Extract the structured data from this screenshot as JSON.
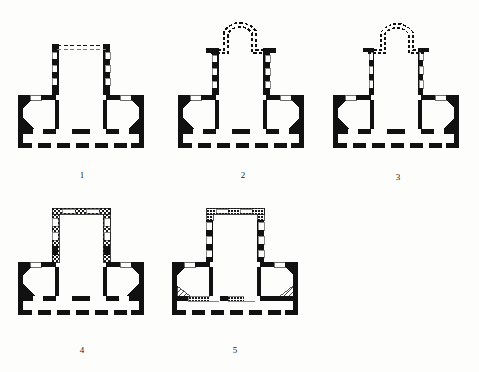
{
  "figure": {
    "kind": "architectural-floor-plan-series",
    "background_color": "#fdfdfb",
    "ink_color": "#111111",
    "plan_count": 5
  },
  "plans": [
    {
      "id": "plan-1",
      "label": "1",
      "label_x": 82,
      "label_y": 178,
      "origin_x": 18,
      "origin_y": 40,
      "nave_top_style": "dashed-open",
      "wall_style": "solid-black-poche",
      "has_apse_extension": false
    },
    {
      "id": "plan-2",
      "label": "2",
      "label_x": 243,
      "label_y": 178,
      "origin_x": 178,
      "origin_y": 14,
      "nave_top_style": "dashed-apse",
      "wall_style": "solid-black-poche",
      "has_apse_extension": true
    },
    {
      "id": "plan-3",
      "label": "3",
      "label_x": 398,
      "label_y": 180,
      "origin_x": 333,
      "origin_y": 14,
      "nave_top_style": "dashed-apse",
      "wall_style": "thin-outline-poche",
      "has_apse_extension": true
    },
    {
      "id": "plan-4",
      "label": "4",
      "label_x": 82,
      "label_y": 353,
      "origin_x": 18,
      "origin_y": 205,
      "nave_top_style": "closed-hatched",
      "wall_style": "stippled-hatched",
      "has_apse_extension": false
    },
    {
      "id": "plan-5",
      "label": "5",
      "label_x": 235,
      "label_y": 353,
      "origin_x": 172,
      "origin_y": 205,
      "nave_top_style": "closed-hatched",
      "wall_style": "stippled-hatched",
      "has_apse_extension": false
    }
  ]
}
